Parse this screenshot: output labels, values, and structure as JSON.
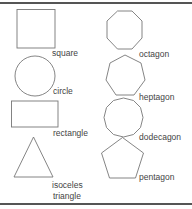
{
  "figure": {
    "stroke_color": "#777777",
    "label_color": "#444444",
    "shapes": [
      {
        "name": "square",
        "label": "square"
      },
      {
        "name": "circle",
        "label": "circle"
      },
      {
        "name": "rectangle",
        "label": "rectangle"
      },
      {
        "name": "isoceles-triangle",
        "label_line1": "isoceles",
        "label_line2": "triangle"
      },
      {
        "name": "octagon",
        "label": "octagon"
      },
      {
        "name": "heptagon",
        "label": "heptagon"
      },
      {
        "name": "dodecagon",
        "label": "dodecagon"
      },
      {
        "name": "pentagon",
        "label": "pentagon"
      }
    ]
  }
}
